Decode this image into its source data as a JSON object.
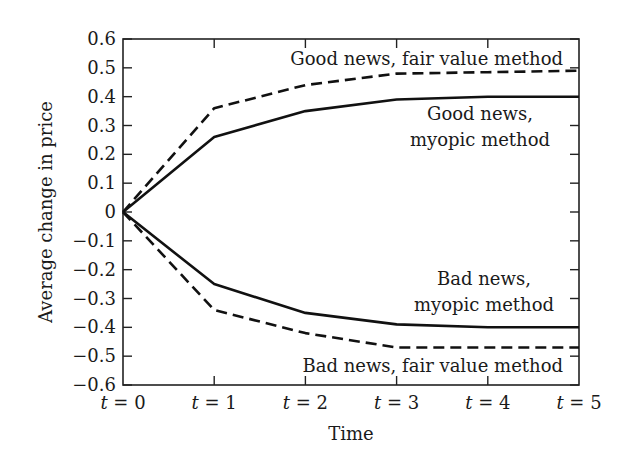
{
  "chart_data": {
    "type": "line",
    "title": "",
    "xlabel": "Time",
    "ylabel": "Average change in price",
    "x": [
      "t = 0",
      "t = 1",
      "t = 2",
      "t = 3",
      "t = 4",
      "t = 5"
    ],
    "ylim": [
      -0.6,
      0.6
    ],
    "yticks": [
      "0.6",
      "0.5",
      "0.4",
      "0.3",
      "0.2",
      "0.1",
      "0",
      "−0.1",
      "−0.2",
      "−0.3",
      "−0.4",
      "−0.5",
      "−0.6"
    ],
    "grid": false,
    "legend": "inline annotations",
    "series": [
      {
        "name": "Good news, fair value method",
        "style": "dashed",
        "values": [
          0,
          0.36,
          0.44,
          0.48,
          0.485,
          0.49
        ]
      },
      {
        "name": "Good news, myopic method",
        "style": "solid",
        "values": [
          0,
          0.26,
          0.35,
          0.39,
          0.4,
          0.4
        ]
      },
      {
        "name": "Bad news, myopic method",
        "style": "solid",
        "values": [
          0,
          -0.25,
          -0.35,
          -0.39,
          -0.4,
          -0.4
        ]
      },
      {
        "name": "Bad news, fair value method",
        "style": "dashed",
        "values": [
          0,
          -0.34,
          -0.42,
          -0.47,
          -0.47,
          -0.47
        ]
      }
    ]
  },
  "annotations": {
    "good_fair": "Good news, fair value method",
    "good_myopic_1": "Good news,",
    "good_myopic_2": "myopic method",
    "bad_myopic_1": "Bad news,",
    "bad_myopic_2": "myopic method",
    "bad_fair": "Bad news, fair value method"
  },
  "colors": {
    "line": "#111111",
    "axis": "#222222",
    "background": "#ffffff"
  }
}
